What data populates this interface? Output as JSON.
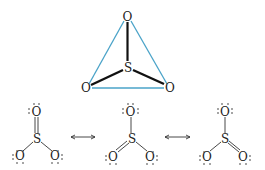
{
  "top_structure": {
    "description": "SO3 3D ball-stick with triangle",
    "atoms": {
      "top_o": "O",
      "center_s": "S",
      "left_o": "O",
      "right_o": "O"
    },
    "triangle_color": "#4aa3c8",
    "bond_color": "#111111"
  },
  "resonance": {
    "structures": [
      {
        "top": "O",
        "center": "S",
        "left": "O",
        "right": "O",
        "double_bond": "top"
      },
      {
        "top": "O",
        "center": "S",
        "left": "O",
        "right": "O",
        "double_bond": "left"
      },
      {
        "top": "O",
        "center": "S",
        "left": "O",
        "right": "O",
        "double_bond": "right"
      }
    ],
    "arrows": [
      "⟷",
      "⟷"
    ]
  }
}
